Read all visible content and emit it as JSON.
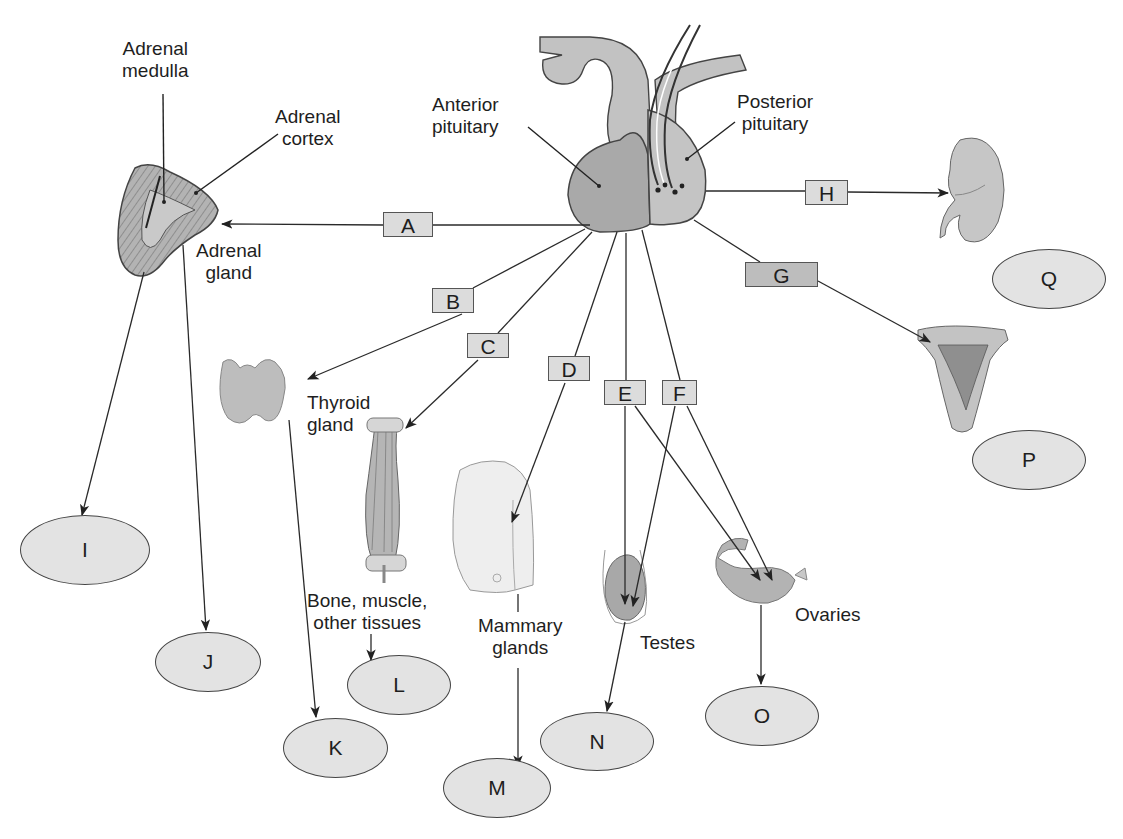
{
  "colors": {
    "background": "#ffffff",
    "box_fill": "#dcdcdc",
    "box_fill_dark": "#bdbdbd",
    "oval_fill": "#e3e3e3",
    "tissue_fill": "#b9b9b9",
    "line": "#2a2a2a"
  },
  "structures": {
    "anterior_pituitary": "Anterior\npituitary",
    "posterior_pituitary": "Posterior\npituitary",
    "adrenal_medulla": "Adrenal\nmedulla",
    "adrenal_cortex": "Adrenal\ncortex",
    "adrenal_gland": "Adrenal\ngland",
    "thyroid_gland": "Thyroid\ngland",
    "bone_muscle": "Bone, muscle,\nother tissues",
    "mammary_glands": "Mammary\nglands",
    "testes": "Testes",
    "ovaries": "Ovaries"
  },
  "hormone_boxes": [
    {
      "id": "A",
      "label": "A",
      "x": 383,
      "y": 212,
      "w": 50,
      "dark": false
    },
    {
      "id": "B",
      "label": "B",
      "x": 432,
      "y": 288,
      "w": 42,
      "dark": false
    },
    {
      "id": "C",
      "label": "C",
      "x": 467,
      "y": 333,
      "w": 42,
      "dark": false
    },
    {
      "id": "D",
      "label": "D",
      "x": 548,
      "y": 356,
      "w": 42,
      "dark": false
    },
    {
      "id": "E",
      "label": "E",
      "x": 604,
      "y": 380,
      "w": 42,
      "dark": false
    },
    {
      "id": "F",
      "label": "F",
      "x": 662,
      "y": 380,
      "w": 35,
      "dark": false
    },
    {
      "id": "G",
      "label": "G",
      "x": 745,
      "y": 262,
      "w": 73,
      "dark": true
    },
    {
      "id": "H",
      "label": "H",
      "x": 805,
      "y": 180,
      "w": 43,
      "dark": false
    }
  ],
  "answer_ovals": [
    {
      "id": "I",
      "label": "I",
      "x": 20,
      "y": 515,
      "w": 130,
      "h": 70
    },
    {
      "id": "J",
      "label": "J",
      "x": 155,
      "y": 632,
      "w": 106,
      "h": 60
    },
    {
      "id": "K",
      "label": "K",
      "x": 283,
      "y": 718,
      "w": 105,
      "h": 60
    },
    {
      "id": "L",
      "label": "L",
      "x": 347,
      "y": 655,
      "w": 104,
      "h": 60
    },
    {
      "id": "M",
      "label": "M",
      "x": 443,
      "y": 758,
      "w": 108,
      "h": 60
    },
    {
      "id": "N",
      "label": "N",
      "x": 540,
      "y": 712,
      "w": 114,
      "h": 59
    },
    {
      "id": "O",
      "label": "O",
      "x": 705,
      "y": 686,
      "w": 114,
      "h": 60
    },
    {
      "id": "P",
      "label": "P",
      "x": 972,
      "y": 430,
      "w": 114,
      "h": 60
    },
    {
      "id": "Q",
      "label": "Q",
      "x": 992,
      "y": 249,
      "w": 114,
      "h": 60
    }
  ],
  "connections": [
    {
      "from": "pituitary",
      "via": "A",
      "to": "adrenal_gland"
    },
    {
      "from": "pituitary",
      "via": "B",
      "to": "thyroid_gland"
    },
    {
      "from": "pituitary",
      "via": "C",
      "to": "bone_muscle"
    },
    {
      "from": "pituitary",
      "via": "D",
      "to": "mammary_glands"
    },
    {
      "from": "pituitary",
      "via": "E",
      "to": "testes"
    },
    {
      "from": "pituitary",
      "via": "E",
      "to": "ovaries"
    },
    {
      "from": "pituitary",
      "via": "F",
      "to": "testes"
    },
    {
      "from": "pituitary",
      "via": "F",
      "to": "ovaries"
    },
    {
      "from": "posterior_pituitary",
      "via": "G",
      "to": "uterus"
    },
    {
      "from": "posterior_pituitary",
      "via": "H",
      "to": "kidney"
    },
    {
      "from": "adrenal_gland",
      "to": "I"
    },
    {
      "from": "adrenal_gland",
      "to": "J"
    },
    {
      "from": "thyroid_gland",
      "to": "K"
    },
    {
      "from": "bone_muscle",
      "to": "L"
    },
    {
      "from": "mammary_glands",
      "to": "M"
    },
    {
      "from": "testes",
      "to": "N"
    },
    {
      "from": "ovaries",
      "to": "O"
    }
  ]
}
